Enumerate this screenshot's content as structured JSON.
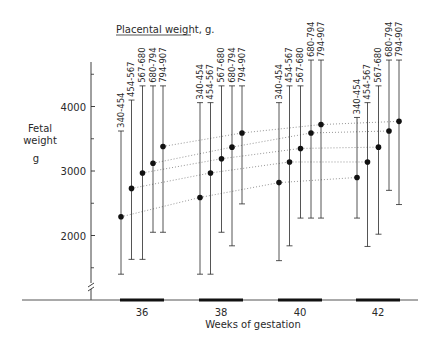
{
  "chart_data": {
    "type": "errorbar",
    "title": "Placental weight, g.",
    "xlabel": "Weeks of gestation",
    "ylabel_lines": [
      "Fetal",
      "weight",
      "g"
    ],
    "ylim": [
      1000,
      4700
    ],
    "yticks": [
      2000,
      3000,
      4000
    ],
    "yticks_minor": [
      1500,
      2500,
      3500,
      4500
    ],
    "axis_break": true,
    "grid": false,
    "categories": [
      "36",
      "38",
      "40",
      "42"
    ],
    "series_labels": [
      "340-454",
      "454-567",
      "567-680",
      "680-794",
      "794-907"
    ],
    "groups": [
      {
        "week": "36",
        "bars": [
          {
            "label": "340-454",
            "mean": 2290,
            "low": 1400,
            "high": 3620
          },
          {
            "label": "454-567",
            "mean": 2730,
            "low": 1630,
            "high": 4100
          },
          {
            "label": "567-680",
            "mean": 2970,
            "low": 1630,
            "high": 4320
          },
          {
            "label": "680-794",
            "mean": 3120,
            "low": 2050,
            "high": 4320
          },
          {
            "label": "794-907",
            "mean": 3380,
            "low": 2050,
            "high": 4320
          }
        ]
      },
      {
        "week": "38",
        "bars": [
          {
            "label": "340-454",
            "mean": 2590,
            "low": 1400,
            "high": 4060
          },
          {
            "label": "454-567",
            "mean": 2970,
            "low": 1400,
            "high": 4060
          },
          {
            "label": "567-680",
            "mean": 3190,
            "low": 2050,
            "high": 4320
          },
          {
            "label": "680-794",
            "mean": 3370,
            "low": 1840,
            "high": 4320
          },
          {
            "label": "794-907",
            "mean": 3590,
            "low": 2490,
            "high": 4320
          }
        ]
      },
      {
        "week": "40",
        "bars": [
          {
            "label": "340-454",
            "mean": 2820,
            "low": 1610,
            "high": 4060
          },
          {
            "label": "454-567",
            "mean": 3140,
            "low": 1840,
            "high": 4320
          },
          {
            "label": "567-680",
            "mean": 3350,
            "low": 2270,
            "high": 4320
          },
          {
            "label": "680-794",
            "mean": 3590,
            "low": 2270,
            "high": 4720
          },
          {
            "label": "794-907",
            "mean": 3720,
            "low": 2270,
            "high": 4720
          }
        ]
      },
      {
        "week": "42",
        "bars": [
          {
            "label": "340-454",
            "mean": 2900,
            "low": 2270,
            "high": 3830
          },
          {
            "label": "454-567",
            "mean": 3140,
            "low": 1830,
            "high": 4060
          },
          {
            "label": "567-680",
            "mean": 3370,
            "low": 2020,
            "high": 4320
          },
          {
            "label": "680-794",
            "mean": 3620,
            "low": 2700,
            "high": 4720
          },
          {
            "label": "794-907",
            "mean": 3770,
            "low": 2480,
            "high": 4720
          }
        ]
      }
    ],
    "trend_lines": "dotted lines connect means of same placental-weight class across weeks"
  },
  "colors": {
    "ink": "#2a2a2a",
    "dotted": "#8a8a8a",
    "background": "#ffffff"
  }
}
